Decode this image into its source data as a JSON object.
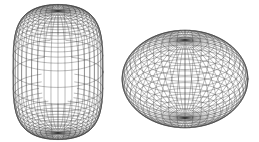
{
  "figure": {
    "width": 259,
    "height": 142,
    "background": "#ffffff",
    "line_color": "#3a3a3a",
    "shapes": [
      {
        "id": "prolate-superellipsoid",
        "description": "tall capsule-like wireframe surface",
        "cx": 58,
        "cy": 72,
        "rx": 45,
        "ry": 45,
        "rz": 65,
        "exponent_z": 0.55,
        "tilt_deg": 20,
        "n_lat": 34,
        "n_lon": 40,
        "stroke_width": 0.35
      },
      {
        "id": "oblate-ellipsoid",
        "description": "flattened wide wireframe surface",
        "cx": 185,
        "cy": 79,
        "rx": 63,
        "ry": 63,
        "rz": 44,
        "exponent_z": 1.0,
        "tilt_deg": 28,
        "n_lat": 26,
        "n_lon": 48,
        "stroke_width": 0.35
      }
    ]
  }
}
